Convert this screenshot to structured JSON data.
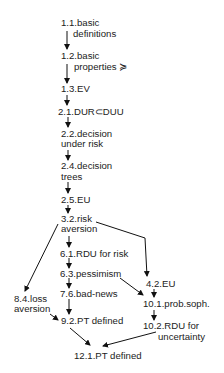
{
  "diagram": {
    "type": "dependency-graph",
    "colors": {
      "text": "#222222",
      "edge": "#111111",
      "background": "#ffffff"
    },
    "nodes": [
      {
        "id": "n11",
        "line1": "1.1.basic",
        "line2": "definitions"
      },
      {
        "id": "n12",
        "line1": "1.2.basic",
        "line2": "properties ≽"
      },
      {
        "id": "n13",
        "line1": "1.3.EV"
      },
      {
        "id": "n21",
        "line1": "2.1.DUR⊂DUU"
      },
      {
        "id": "n22",
        "line1": "2.2.decision",
        "line2": "under risk"
      },
      {
        "id": "n24",
        "line1": "2.4.decision",
        "line2": "trees"
      },
      {
        "id": "n25",
        "line1": "2.5.EU"
      },
      {
        "id": "n32",
        "line1": "3.2.risk",
        "line2": "aversion"
      },
      {
        "id": "n61",
        "line1": "6.1.RDU for risk"
      },
      {
        "id": "n63",
        "line1": "6.3.pessimism"
      },
      {
        "id": "n42",
        "line1": "4.2.EU"
      },
      {
        "id": "n76",
        "line1": "7.6.bad-news"
      },
      {
        "id": "n84",
        "line1": "8.4.loss",
        "line2": "aversion"
      },
      {
        "id": "n101",
        "line1": "10.1.prob.soph."
      },
      {
        "id": "n92",
        "line1": "9.2.PT defined"
      },
      {
        "id": "n102",
        "line1": "10.2.RDU for",
        "line2": "uncertainty"
      },
      {
        "id": "n121",
        "line1": "12.1.PT defined"
      }
    ],
    "edges": [
      [
        "1.1",
        "1.2"
      ],
      [
        "1.2",
        "1.3"
      ],
      [
        "1.3",
        "2.1"
      ],
      [
        "2.1",
        "2.2"
      ],
      [
        "2.2",
        "2.4"
      ],
      [
        "2.4",
        "2.5"
      ],
      [
        "2.5",
        "3.2"
      ],
      [
        "3.2",
        "6.1"
      ],
      [
        "3.2",
        "8.4"
      ],
      [
        "3.2",
        "4.2"
      ],
      [
        "6.1",
        "6.3"
      ],
      [
        "6.3",
        "7.6"
      ],
      [
        "6.3",
        "10.1"
      ],
      [
        "4.2",
        "10.1"
      ],
      [
        "7.6",
        "9.2"
      ],
      [
        "8.4",
        "9.2"
      ],
      [
        "10.1",
        "10.2"
      ],
      [
        "9.2",
        "12.1"
      ],
      [
        "10.2",
        "12.1"
      ]
    ]
  }
}
